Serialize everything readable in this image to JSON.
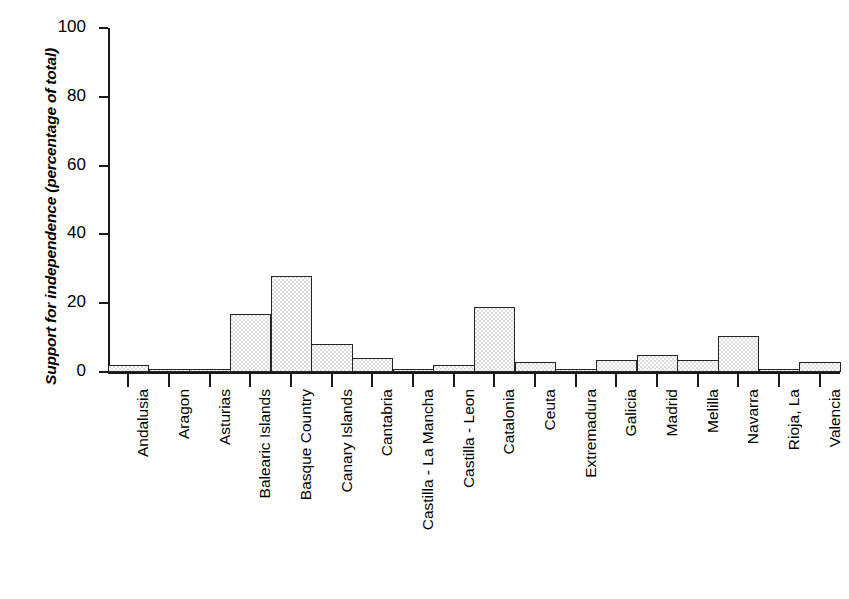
{
  "chart_data": {
    "type": "bar",
    "title": "",
    "subtitle": "",
    "xlabel": "",
    "ylabel": "Support for independence (percentage of total)",
    "ylim": [
      0,
      100
    ],
    "xlim_note": "categorical, contiguous bars (histogram style)",
    "grid": false,
    "legend": null,
    "yticks": [
      0,
      20,
      40,
      60,
      80,
      100
    ],
    "ytick_labels": [
      "0",
      "20",
      "40",
      "60",
      "80",
      "100"
    ],
    "bar_style": {
      "fill": "#dcdcdc",
      "pattern": "stippled-dots",
      "edge": "#262626"
    },
    "categories": [
      "Andalusia",
      "Aragon",
      "Asturias",
      "Balearic Islands",
      "Basque Country",
      "Canary Islands",
      "Cantabria",
      "Castilla - La Mancha",
      "Castilla - Leon",
      "Catalonia",
      "Ceuta",
      "Extremadura",
      "Galicia",
      "Madrid",
      "Melilla",
      "Navarra",
      "Rioja, La",
      "Valencia"
    ],
    "values": [
      2,
      0.3,
      0.3,
      17,
      28,
      8,
      4,
      0.3,
      2,
      19,
      3,
      1,
      3.5,
      5,
      3.5,
      10.5,
      0.8,
      3
    ],
    "units": "percentage of total"
  },
  "axes": {
    "y_axis_label": "Support for independence (percentage of total)",
    "y_tick_labels": [
      "100",
      "80",
      "60",
      "40",
      "20",
      "0"
    ]
  }
}
